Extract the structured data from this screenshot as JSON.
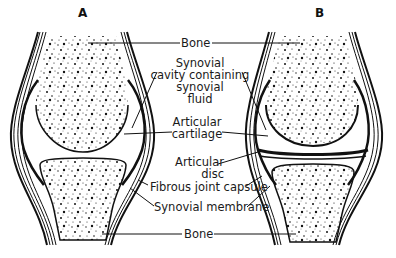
{
  "figure": {
    "panels": [
      {
        "id": "A",
        "label": "A"
      },
      {
        "id": "B",
        "label": "B"
      }
    ],
    "labels": {
      "bone_top": "Bone",
      "synovial_cavity": [
        "Synovial",
        "cavity containing",
        "synovial",
        "fluid"
      ],
      "articular_cartilage": [
        "Articular",
        "cartilage"
      ],
      "articular_disc": [
        "Articular",
        "disc"
      ],
      "fibrous_capsule": "Fibrous joint capsule",
      "synovial_membrane": "Synovial membrane",
      "bone_bottom": "Bone"
    },
    "colors": {
      "ink": "#111111",
      "background": "#ffffff"
    }
  }
}
